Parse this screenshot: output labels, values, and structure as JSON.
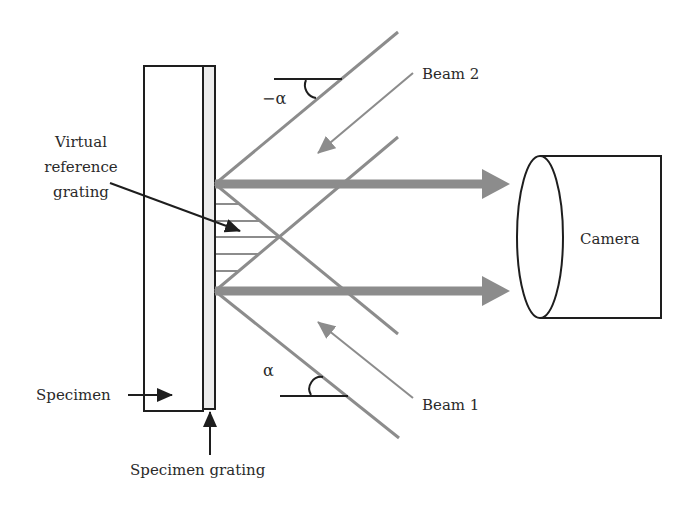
{
  "diagram": {
    "labels": {
      "virtual_reference_grating": [
        "Virtual",
        "reference",
        "grating"
      ],
      "beam_2": "Beam 2",
      "beam_1": "Beam 1",
      "camera": "Camera",
      "specimen": "Specimen",
      "specimen_grating": "Specimen grating",
      "angle_neg_alpha": "−α",
      "angle_alpha": "α"
    },
    "colors": {
      "beam_gray": "#8c8c8c",
      "outline_black": "#1e1e1e",
      "grating_fill": "#ececec"
    }
  }
}
